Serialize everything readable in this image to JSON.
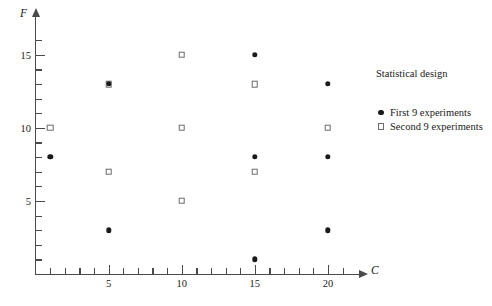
{
  "chart_data": {
    "type": "scatter",
    "title": "Statistical design",
    "xlabel": "C",
    "ylabel": "F",
    "xlim": [
      0,
      22
    ],
    "ylim": [
      0,
      17
    ],
    "grid": false,
    "legend_position": "right",
    "x_ticks_major": [
      5,
      10,
      15,
      20
    ],
    "x_ticks_minor": [
      1,
      2,
      3,
      4,
      6,
      7,
      8,
      9,
      11,
      12,
      13,
      14,
      16,
      17,
      18,
      19,
      21
    ],
    "x_tick_labels": [
      "5",
      "10",
      "15",
      "20"
    ],
    "y_ticks_major": [
      5,
      10,
      15
    ],
    "y_ticks_minor": [
      1,
      2,
      3,
      4,
      6,
      7,
      8,
      9,
      11,
      12,
      13,
      14,
      16
    ],
    "y_tick_labels": [
      "5",
      "10",
      "15"
    ],
    "series": [
      {
        "name": "First 9 experiments",
        "marker": "filled-circle",
        "color": "#1a1a1a",
        "points": [
          {
            "x": 1,
            "y": 8
          },
          {
            "x": 5,
            "y": 13
          },
          {
            "x": 5,
            "y": 3
          },
          {
            "x": 15,
            "y": 15
          },
          {
            "x": 15,
            "y": 8
          },
          {
            "x": 15,
            "y": 1
          },
          {
            "x": 20,
            "y": 13
          },
          {
            "x": 20,
            "y": 8
          },
          {
            "x": 20,
            "y": 3
          }
        ]
      },
      {
        "name": "Second 9 experiments",
        "marker": "open-square",
        "color": "#6b6b6b",
        "points": [
          {
            "x": 1,
            "y": 10
          },
          {
            "x": 5,
            "y": 13
          },
          {
            "x": 5,
            "y": 7
          },
          {
            "x": 10,
            "y": 15
          },
          {
            "x": 10,
            "y": 10
          },
          {
            "x": 10,
            "y": 5
          },
          {
            "x": 15,
            "y": 13
          },
          {
            "x": 15,
            "y": 7
          },
          {
            "x": 20,
            "y": 10
          }
        ]
      }
    ]
  },
  "legend": {
    "title": "Statistical design",
    "entries": [
      {
        "label": "First 9 experiments",
        "marker": "filled-circle"
      },
      {
        "label": "Second 9 experiments",
        "marker": "open-square"
      }
    ]
  },
  "axes": {
    "x_name": "C",
    "y_name": "F"
  }
}
